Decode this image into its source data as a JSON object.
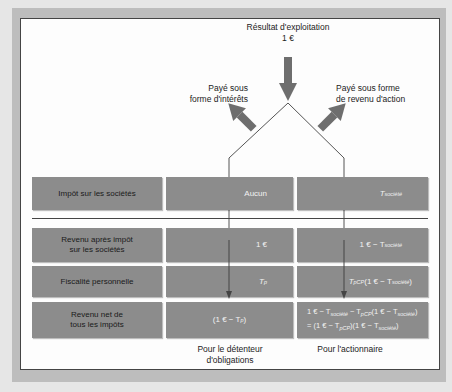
{
  "diagram": {
    "top": {
      "title_line1": "Résultat d'exploitation",
      "title_line2": "1 €"
    },
    "branches": {
      "left_line1": "Payé sous",
      "left_line2": "forme d'intérêts",
      "right_line1": "Payé sous forme",
      "right_line2": "de revenu d'action"
    },
    "rows": [
      {
        "label_line1": "Impôt sur les sociétés",
        "label_line2": "",
        "bond": "Aucun",
        "equity_main": "T",
        "equity_sub": "société"
      },
      {
        "label_line1": "Revenu après impôt",
        "label_line2": "sur les sociétés",
        "bond": "1 €",
        "equity_main": "1 € − T",
        "equity_sub": "société"
      },
      {
        "label_line1": "Fiscalité personnelle",
        "label_line2": "",
        "bond_main": "T",
        "bond_sub": "p",
        "equity_main": "T",
        "equity_sub": "pCP",
        "equity_rest": "(1 € − T",
        "equity_sub2": "société",
        "equity_close": ")"
      },
      {
        "label_line1": "Revenu net de",
        "label_line2": "tous les impôts",
        "bond_open": "(1 € − T",
        "bond_sub": "p",
        "bond_close": ")",
        "equity_line1_a": "1 € − T",
        "equity_line1_sub1": "société",
        "equity_line1_b": " − T",
        "equity_line1_sub2": "pCP",
        "equity_line1_c": "(1 € − T",
        "equity_line1_sub3": "société",
        "equity_line1_d": ")",
        "equity_line2_a": "= (1 € − T",
        "equity_line2_sub1": "pCP",
        "equity_line2_b": ")(1 € − T",
        "equity_line2_sub2": "société",
        "equity_line2_c": ")"
      }
    ],
    "footer": {
      "bond_line1": "Pour le détenteur",
      "bond_line2": "d'obligations",
      "equity": "Pour l'actionnaire"
    },
    "colors": {
      "box_fill": "#8c8c8c",
      "arrow_fill": "#6e6e6e",
      "frame": "#bdbdbd",
      "line": "#555555"
    }
  }
}
